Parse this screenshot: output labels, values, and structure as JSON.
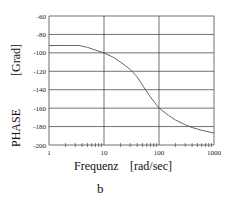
{
  "chart_data": {
    "type": "line",
    "title": "",
    "panel_label": "b",
    "xlabel": "Frequenz",
    "xunit": "[rad/sec]",
    "ylabel": "PHASE",
    "yunit": "[Grad]",
    "xscale": "log",
    "xlim": [
      1,
      1000
    ],
    "ylim": [
      -200,
      -60
    ],
    "xticks": [
      "1",
      "10",
      "100",
      "1000"
    ],
    "yticks": [
      "-60",
      "-80",
      "-100",
      "-120",
      "-140",
      "-160",
      "-180",
      "-200"
    ],
    "grid": true,
    "series": [
      {
        "name": "phase",
        "x": [
          1,
          2,
          3.5,
          5,
          7,
          10,
          15,
          20,
          30,
          40,
          50,
          70,
          100,
          150,
          200,
          300,
          400,
          600,
          1000
        ],
        "values": [
          -92,
          -92,
          -92,
          -94,
          -97,
          -100,
          -105,
          -110,
          -118,
          -126,
          -135,
          -148,
          -160,
          -168,
          -173,
          -178,
          -181,
          -184,
          -187
        ]
      }
    ],
    "line_color": "#555555",
    "grid_color": "#333333"
  }
}
